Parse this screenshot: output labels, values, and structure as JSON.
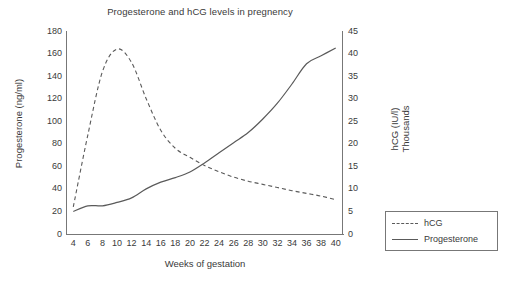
{
  "chart_data": {
    "type": "line",
    "title": "Progesterone and hCG levels in pregnency",
    "xlabel": "Weeks of gestation",
    "ylabel": "Progesterone (ng/ml)",
    "y2label_line1": "hCG (IU/l)",
    "y2label_line2": "Thousands",
    "xlim": [
      3,
      41
    ],
    "ylim": [
      0,
      180
    ],
    "y2lim": [
      0,
      45
    ],
    "grid": false,
    "legend_position": "right-outside",
    "x_ticks": [
      4,
      6,
      8,
      10,
      12,
      14,
      16,
      18,
      20,
      22,
      24,
      26,
      28,
      30,
      32,
      34,
      36,
      38,
      40
    ],
    "y_ticks": [
      0,
      20,
      40,
      60,
      80,
      100,
      120,
      140,
      160,
      180
    ],
    "y2_ticks": [
      0,
      5,
      10,
      15,
      20,
      25,
      30,
      35,
      40,
      45
    ],
    "x": [
      4,
      6,
      8,
      10,
      12,
      14,
      16,
      18,
      20,
      22,
      24,
      26,
      28,
      30,
      32,
      34,
      36,
      38,
      40
    ],
    "series": [
      {
        "name": "hCG",
        "axis": "right",
        "style": "dashed",
        "color": "#5a5a5a",
        "units": "IU/l (thousands)",
        "values": [
          6.0,
          22.0,
          36.0,
          41.0,
          38.0,
          30.0,
          23.0,
          19.0,
          17.0,
          15.2,
          13.8,
          12.6,
          11.7,
          11.0,
          10.3,
          9.6,
          9.0,
          8.4,
          7.6
        ]
      },
      {
        "name": "Progesterone",
        "axis": "left",
        "style": "solid",
        "color": "#5a5a5a",
        "units": "ng/ml",
        "values": [
          20,
          25,
          25,
          28,
          32,
          40,
          46,
          50,
          55,
          63,
          72,
          81,
          90,
          102,
          116,
          133,
          151,
          158,
          165
        ]
      }
    ],
    "annotations": []
  },
  "legend": {
    "items": [
      {
        "label": "hCG",
        "style": "dashed"
      },
      {
        "label": "Progesterone",
        "style": "solid"
      }
    ]
  },
  "colors": {
    "line": "#5a5a5a",
    "axis": "#777777",
    "text": "#3a3a3a",
    "background": "#ffffff"
  }
}
